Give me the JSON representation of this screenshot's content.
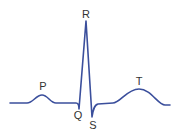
{
  "diagram": {
    "stroke_color": "#3b4f9c",
    "label_color": "#333333",
    "labels": {
      "p": "P",
      "q": "Q",
      "r": "R",
      "s": "S",
      "t": "T"
    },
    "waves": [
      "P",
      "Q",
      "R",
      "S",
      "T"
    ]
  }
}
